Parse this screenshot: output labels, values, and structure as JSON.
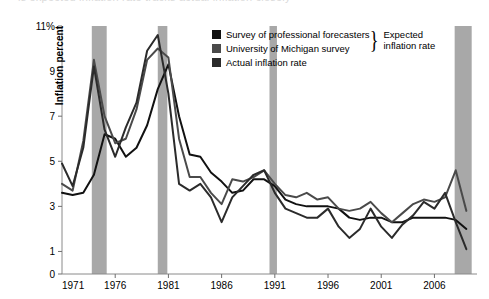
{
  "top_bleed_text": "is expected inflation rate tracks actual inflation closely",
  "legend": {
    "items": [
      {
        "label": "Survey of professional forecasters",
        "color": "#111111",
        "key": "spf"
      },
      {
        "label": "University of Michigan survey",
        "color": "#4a4a4a",
        "key": "umich"
      },
      {
        "label": "Actual inflation rate",
        "color": "#2b2b2b",
        "key": "actual"
      }
    ],
    "brace_glyph": "}",
    "brace_label_line1": "Expected",
    "brace_label_line2": "inflation rate"
  },
  "axes": {
    "ylabel": "Inflation percent",
    "y_ticks": [
      "0",
      "1",
      "3",
      "5",
      "7",
      "9",
      "11%"
    ],
    "y_tick_values": [
      0,
      1,
      3,
      5,
      7,
      9,
      11
    ],
    "x_ticks": [
      "1971",
      "1976",
      "1981",
      "1986",
      "1991",
      "1996",
      "2001",
      "2006"
    ],
    "x_tick_values": [
      1971,
      1976,
      1981,
      1986,
      1991,
      1996,
      2001,
      2006
    ]
  },
  "chart_data": {
    "type": "line",
    "title": "",
    "xlabel": "",
    "ylabel": "Inflation percent",
    "xlim": [
      1971,
      2010
    ],
    "ylim": [
      0,
      11
    ],
    "grid": false,
    "legend_position": "top-center",
    "recession_bands": [
      {
        "start": 1973.8,
        "end": 1975.2
      },
      {
        "start": 1980.0,
        "end": 1980.9
      },
      {
        "start": 1990.5,
        "end": 1991.2
      },
      {
        "start": 2007.9,
        "end": 2009.5
      }
    ],
    "band_color": "#a8a8a8",
    "series": [
      {
        "name": "Survey of professional forecasters",
        "color": "#111111",
        "x": [
          1971,
          1972,
          1973,
          1974,
          1975,
          1976,
          1977,
          1978,
          1979,
          1980,
          1981,
          1982,
          1983,
          1984,
          1985,
          1986,
          1987,
          1988,
          1989,
          1990,
          1991,
          1992,
          1993,
          1994,
          1995,
          1996,
          1997,
          1998,
          1999,
          2000,
          2001,
          2002,
          2003,
          2004,
          2005,
          2006,
          2007,
          2008,
          2009
        ],
        "values": [
          3.6,
          3.5,
          3.6,
          4.4,
          6.2,
          6.0,
          5.2,
          5.6,
          6.6,
          8.2,
          9.3,
          7.0,
          5.3,
          5.2,
          4.5,
          4.1,
          3.6,
          3.7,
          4.2,
          4.2,
          3.9,
          3.3,
          3.1,
          3.0,
          3.0,
          3.0,
          2.9,
          2.5,
          2.4,
          2.5,
          2.5,
          2.3,
          2.3,
          2.5,
          2.5,
          2.5,
          2.5,
          2.4,
          2.0
        ]
      },
      {
        "name": "University of Michigan survey",
        "color": "#4a4a4a",
        "x": [
          1971,
          1972,
          1973,
          1974,
          1975,
          1976,
          1977,
          1978,
          1979,
          1980,
          1981,
          1982,
          1983,
          1984,
          1985,
          1986,
          1987,
          1988,
          1989,
          1990,
          1991,
          1992,
          1993,
          1994,
          1995,
          1996,
          1997,
          1998,
          1999,
          2000,
          2001,
          2002,
          2003,
          2004,
          2005,
          2006,
          2007,
          2008,
          2009
        ],
        "values": [
          4.0,
          3.7,
          5.9,
          9.5,
          7.0,
          5.8,
          6.0,
          7.3,
          9.5,
          10.0,
          9.6,
          6.0,
          4.3,
          4.3,
          3.6,
          3.1,
          4.2,
          4.1,
          4.3,
          4.6,
          4.0,
          3.5,
          3.4,
          3.6,
          3.3,
          3.4,
          2.9,
          2.8,
          2.9,
          3.2,
          2.7,
          2.3,
          2.7,
          3.1,
          3.3,
          3.2,
          3.4,
          4.6,
          2.8
        ]
      },
      {
        "name": "Actual inflation rate",
        "color": "#2b2b2b",
        "x": [
          1971,
          1972,
          1973,
          1974,
          1975,
          1976,
          1977,
          1978,
          1979,
          1980,
          1981,
          1982,
          1983,
          1984,
          1985,
          1986,
          1987,
          1988,
          1989,
          1990,
          1991,
          1992,
          1993,
          1994,
          1995,
          1996,
          1997,
          1998,
          1999,
          2000,
          2001,
          2002,
          2003,
          2004,
          2005,
          2006,
          2007,
          2008,
          2009
        ],
        "values": [
          4.9,
          3.9,
          5.6,
          9.2,
          6.4,
          5.2,
          6.5,
          7.6,
          9.9,
          10.6,
          8.0,
          4.0,
          3.7,
          4.0,
          3.4,
          2.3,
          3.4,
          3.9,
          4.4,
          4.6,
          3.6,
          2.9,
          2.7,
          2.5,
          2.5,
          2.9,
          2.1,
          1.6,
          2.0,
          2.9,
          2.1,
          1.6,
          2.2,
          2.6,
          3.2,
          2.9,
          3.6,
          2.3,
          1.1
        ]
      }
    ]
  }
}
